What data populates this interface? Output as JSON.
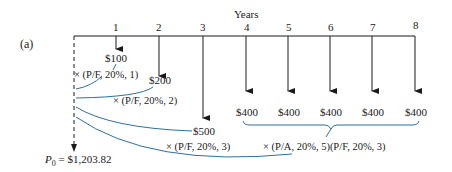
{
  "panel_label": "(a)",
  "axis_title": "Years",
  "years": [
    {
      "n": "1",
      "x": 116
    },
    {
      "n": "2",
      "x": 159
    },
    {
      "n": "3",
      "x": 203
    },
    {
      "n": "4",
      "x": 246
    },
    {
      "n": "5",
      "x": 288
    },
    {
      "n": "6",
      "x": 330
    },
    {
      "n": "7",
      "x": 372
    },
    {
      "n": "8",
      "x": 415
    }
  ],
  "cash_flows": [
    {
      "year": "1",
      "amount": "$100",
      "factor": "× (P/F, 20%, 1)"
    },
    {
      "year": "2",
      "amount": "$200",
      "factor": "× (P/F, 20%, 2)"
    },
    {
      "year": "3",
      "amount": "$500",
      "factor": "× (P/F, 20%, 3)"
    },
    {
      "year": "4",
      "amount": "$400"
    },
    {
      "year": "5",
      "amount": "$400"
    },
    {
      "year": "6",
      "amount": "$400"
    },
    {
      "year": "7",
      "amount": "$400"
    },
    {
      "year": "8",
      "amount": "$400"
    }
  ],
  "annuity_factor": "× (P/A, 20%, 5)(P/F, 20%, 3)",
  "present_value": {
    "symbol": "P",
    "subscript": "0",
    "value": "= $1,203.82"
  },
  "colors": {
    "line": "#1a1a1a",
    "curve": "#2e6f9e"
  }
}
